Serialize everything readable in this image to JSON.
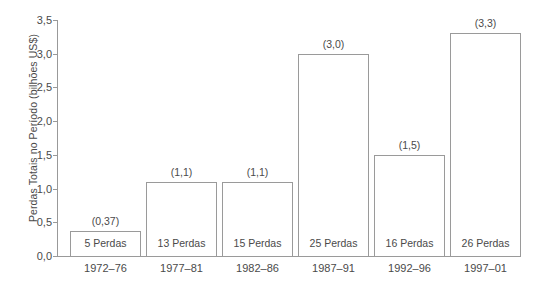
{
  "chart_data": {
    "type": "bar",
    "title": "",
    "subtitle": "",
    "xlabel": "",
    "ylabel": "Perdas Totais no Período (bilhões US$)",
    "categories": [
      "1972–76",
      "1977–81",
      "1982–86",
      "1987–91",
      "1992–96",
      "1997–01"
    ],
    "values": [
      0.37,
      1.1,
      1.1,
      3.0,
      1.5,
      3.3
    ],
    "value_labels": [
      "(0,37)",
      "(1,1)",
      "(1,1)",
      "(3,0)",
      "(1,5)",
      "(3,3)"
    ],
    "bar_inner_labels": [
      "5 Perdas",
      "13 Perdas",
      "15 Perdas",
      "25 Perdas",
      "16 Perdas",
      "26 Perdas"
    ],
    "losses_counts": [
      5,
      13,
      15,
      25,
      16,
      26
    ],
    "ylim": [
      0.0,
      3.5
    ],
    "ytick_values": [
      0.0,
      0.5,
      1.0,
      1.5,
      2.0,
      2.5,
      3.0,
      3.5
    ],
    "ytick_labels": [
      "0,0",
      "0,5",
      "1,0",
      "1,5",
      "2,0",
      "2,5",
      "3,0",
      "3,5"
    ],
    "grid": false,
    "legend": false,
    "legend_position": "none",
    "bar_fill_color": "#ffffff",
    "bar_edge_color": "#9a9a9a",
    "axis_color": "#999999",
    "text_color": "#4a4a4a",
    "background_color": "#ffffff"
  }
}
